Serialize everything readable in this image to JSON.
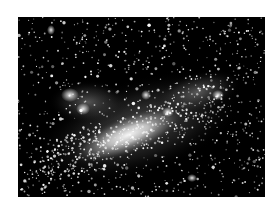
{
  "image": {
    "subject": "galaxy",
    "description": "Black-and-white astronomical photograph of an irregular galaxy (resembling the Large Magellanic Cloud) with a bright central bar and star-forming regions against a dense star field",
    "background_color": "#ffffff",
    "sky_color": "#000000",
    "star_color": "#ffffff"
  }
}
